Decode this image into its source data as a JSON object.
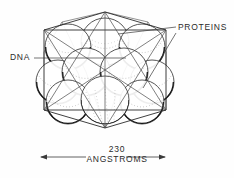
{
  "figure": {
    "background_color": "#fefefe",
    "line_color": "#2b2b2b",
    "shade_color": "#111111",
    "stipple_color": "#6e6e6e",
    "labels": {
      "dna": "DNA",
      "proteins": "PROTEINS"
    },
    "scale": {
      "value": "230",
      "units": "ANGSTROMS",
      "arrow_left_x": 40,
      "arrow_right_x": 166,
      "arrow_y": 157
    },
    "cage": {
      "top_apex": [
        105,
        12
      ],
      "bottom_apex": [
        105,
        128
      ],
      "left_top": [
        44,
        30
      ],
      "right_top": [
        166,
        30
      ],
      "left_bottom": [
        44,
        110
      ],
      "right_bottom": [
        166,
        110
      ],
      "mid_left": [
        62,
        22
      ],
      "mid_right": [
        148,
        22
      ]
    },
    "spheres": [
      {
        "cx": 105,
        "cy": 42,
        "r": 24,
        "row": "top-center"
      },
      {
        "cx": 68,
        "cy": 47,
        "r": 23,
        "row": "top-left"
      },
      {
        "cx": 142,
        "cy": 47,
        "r": 23,
        "row": "top-right"
      },
      {
        "cx": 86,
        "cy": 72,
        "r": 24,
        "row": "mid-left"
      },
      {
        "cx": 124,
        "cy": 72,
        "r": 24,
        "row": "mid-right"
      },
      {
        "cx": 58,
        "cy": 82,
        "r": 22,
        "row": "mid-far-left"
      },
      {
        "cx": 152,
        "cy": 82,
        "r": 22,
        "row": "mid-far-right"
      },
      {
        "cx": 105,
        "cy": 100,
        "r": 24,
        "row": "bottom-center"
      },
      {
        "cx": 68,
        "cy": 102,
        "r": 22,
        "row": "bottom-left"
      },
      {
        "cx": 142,
        "cy": 102,
        "r": 22,
        "row": "bottom-right"
      }
    ],
    "leaders": {
      "dna": {
        "from": [
          34,
          58
        ],
        "to": [
          126,
          58
        ]
      },
      "proteins_upper": {
        "from": [
          176,
          28
        ],
        "to": [
          118,
          35
        ]
      },
      "proteins_lower": {
        "from": [
          176,
          32
        ],
        "to": [
          140,
          88
        ]
      }
    }
  }
}
